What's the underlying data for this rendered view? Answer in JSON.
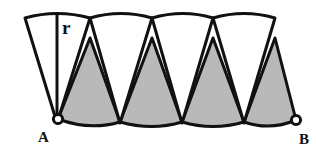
{
  "figure": {
    "type": "geometry-diagram",
    "background_color": "#ffffff",
    "stroke_color": "#111111",
    "stroke_width": 3.0,
    "white_sector_fill": "#ffffff",
    "gray_sector_fill": "#b9b9b9",
    "endpoint_marker_fill": "#ffffff",
    "canvas": {
      "width": 316,
      "height": 154
    }
  },
  "labels": {
    "radius": "r",
    "point_a": "A",
    "point_b": "B"
  },
  "geometry": {
    "radius_px": 107,
    "sector_count_white": 4,
    "sector_count_gray": 4,
    "top_baseline_y": 16,
    "bottom_baseline_y": 122,
    "white_apex_y": 123,
    "gray_apex_y": 38,
    "arc_junctions_x": [
      25,
      90,
      152,
      213,
      275
    ],
    "white_apexes_x": [
      57,
      120,
      182,
      244
    ],
    "gray_apexes_x": [
      90,
      152,
      213,
      275
    ],
    "point_a": {
      "x": 58,
      "y": 119,
      "r": 4.5
    },
    "point_b": {
      "x": 296,
      "y": 120,
      "r": 4.5
    },
    "radius_line": {
      "x1": 57,
      "y1": 15,
      "x2": 57,
      "y2": 123
    },
    "radius_label_pos": {
      "x": 63,
      "y": 33
    },
    "label_a_pos": {
      "x": 38,
      "y": 141
    },
    "label_b_pos": {
      "x": 299,
      "y": 143
    }
  }
}
